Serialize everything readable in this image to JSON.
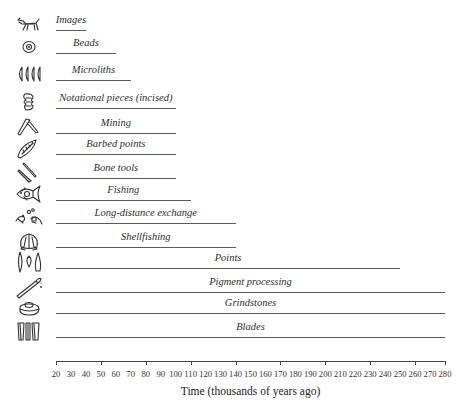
{
  "chart_data": {
    "type": "bar",
    "orientation": "horizontal-range",
    "title": "",
    "xlabel": "Time (thousands of years ago)",
    "ylabel": "",
    "xlim": [
      20,
      280
    ],
    "grid": false,
    "legend": "none",
    "x_ticks": [
      20,
      30,
      40,
      50,
      60,
      70,
      80,
      90,
      100,
      110,
      120,
      130,
      140,
      150,
      160,
      170,
      180,
      190,
      200,
      210,
      220,
      230,
      240,
      250,
      260,
      270,
      280
    ],
    "categories": [
      "Images",
      "Beads",
      "Microliths",
      "Notational pieces (incised)",
      "Mining",
      "Barbed points",
      "Bone tools",
      "Fishing",
      "Long-distance exchange",
      "Shellfishing",
      "Points",
      "Pigment processing",
      "Grindstones",
      "Blades"
    ],
    "series": [
      {
        "name": "Earliest appearance (thousands of years ago)",
        "start": [
          20,
          20,
          20,
          20,
          20,
          20,
          20,
          20,
          20,
          20,
          20,
          20,
          20,
          20
        ],
        "values": [
          40,
          60,
          70,
          100,
          100,
          100,
          100,
          110,
          140,
          140,
          250,
          280,
          280,
          280
        ]
      }
    ],
    "icons": [
      "animal-painting-icon",
      "bead-icon",
      "microliths-icon",
      "incised-piece-icon",
      "pick-icon",
      "barbed-point-icon",
      "bone-tools-icon",
      "fish-icon",
      "exchange-icon",
      "shell-icon",
      "points-icon",
      "pigment-icon",
      "grindstone-icon",
      "blades-icon"
    ]
  },
  "layout": {
    "axis_x0_px": 56,
    "axis_x1_px": 445,
    "row_y_px": [
      30,
      53,
      80,
      108,
      133,
      154,
      178,
      200,
      223,
      247,
      268,
      292,
      313,
      337
    ],
    "axis_y_px": 361,
    "line_color": "#5a5a5a"
  }
}
